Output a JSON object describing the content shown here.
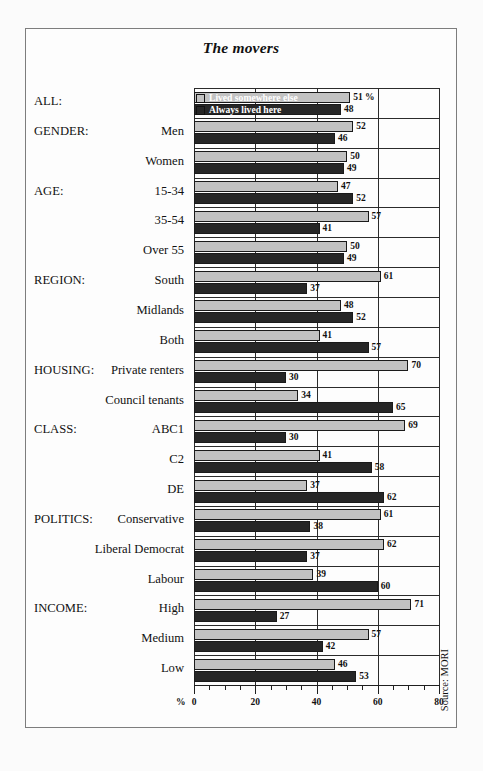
{
  "chart": {
    "title": "The movers",
    "source": "Source: MORI",
    "percent_symbol": "%",
    "legend": [
      {
        "label": "Lived somewhere else",
        "color": "#c2c2c2"
      },
      {
        "label": "Always lived here",
        "color": "#262626"
      }
    ]
  },
  "chart_data": {
    "type": "bar",
    "orientation": "horizontal",
    "title": "The movers",
    "xlabel": "%",
    "ylabel": "",
    "xlim": [
      0,
      80
    ],
    "xticks": [
      0,
      20,
      40,
      60,
      80
    ],
    "minor_tick_step": 5,
    "grid": true,
    "legend_position": "overlaid-on-first-group",
    "source": "Source: MORI",
    "series": [
      {
        "name": "Lived somewhere else",
        "color": "#c2c2c2",
        "values": [
          51,
          52,
          50,
          47,
          57,
          50,
          61,
          48,
          41,
          70,
          34,
          69,
          41,
          37,
          61,
          62,
          39,
          71,
          57,
          46
        ]
      },
      {
        "name": "Always lived here",
        "color": "#262626",
        "values": [
          48,
          46,
          49,
          52,
          41,
          49,
          37,
          52,
          57,
          30,
          65,
          30,
          58,
          62,
          38,
          37,
          60,
          27,
          42,
          53
        ]
      }
    ],
    "categories": [
      "ALL:",
      "Men",
      "Women",
      "15-34",
      "35-54",
      "Over 55",
      "South",
      "Midlands",
      "Both",
      "Private renters",
      "Council tenants",
      "ABC1",
      "C2",
      "DE",
      "Conservative",
      "Liberal Democrat",
      "Labour",
      "High",
      "Medium",
      "Low"
    ],
    "first_value_suffix": "%"
  },
  "rows": [
    {
      "group": "ALL:",
      "label": "",
      "light": 51,
      "dark": 48,
      "light_suffix": " %",
      "dark_suffix": ""
    },
    {
      "group": "GENDER:",
      "label": "Men",
      "light": 52,
      "dark": 46,
      "light_suffix": "",
      "dark_suffix": ""
    },
    {
      "group": "",
      "label": "Women",
      "light": 50,
      "dark": 49,
      "light_suffix": "",
      "dark_suffix": ""
    },
    {
      "group": "AGE:",
      "label": "15-34",
      "light": 47,
      "dark": 52,
      "light_suffix": "",
      "dark_suffix": ""
    },
    {
      "group": "",
      "label": "35-54",
      "light": 57,
      "dark": 41,
      "light_suffix": "",
      "dark_suffix": ""
    },
    {
      "group": "",
      "label": "Over 55",
      "light": 50,
      "dark": 49,
      "light_suffix": "",
      "dark_suffix": ""
    },
    {
      "group": "REGION:",
      "label": "South",
      "light": 61,
      "dark": 37,
      "light_suffix": "",
      "dark_suffix": ""
    },
    {
      "group": "",
      "label": "Midlands",
      "light": 48,
      "dark": 52,
      "light_suffix": "",
      "dark_suffix": ""
    },
    {
      "group": "",
      "label": "Both",
      "light": 41,
      "dark": 57,
      "light_suffix": "",
      "dark_suffix": ""
    },
    {
      "group": "HOUSING:",
      "label": "Private renters",
      "light": 70,
      "dark": 30,
      "light_suffix": "",
      "dark_suffix": ""
    },
    {
      "group": "",
      "label": "Council tenants",
      "light": 34,
      "dark": 65,
      "light_suffix": "",
      "dark_suffix": ""
    },
    {
      "group": "CLASS:",
      "label": "ABC1",
      "light": 69,
      "dark": 30,
      "light_suffix": "",
      "dark_suffix": ""
    },
    {
      "group": "",
      "label": "C2",
      "light": 41,
      "dark": 58,
      "light_suffix": "",
      "dark_suffix": ""
    },
    {
      "group": "",
      "label": "DE",
      "light": 37,
      "dark": 62,
      "light_suffix": "",
      "dark_suffix": ""
    },
    {
      "group": "POLITICS:",
      "label": "Conservative",
      "light": 61,
      "dark": 38,
      "light_suffix": "",
      "dark_suffix": ""
    },
    {
      "group": "",
      "label": "Liberal Democrat",
      "light": 62,
      "dark": 37,
      "light_suffix": "",
      "dark_suffix": ""
    },
    {
      "group": "",
      "label": "Labour",
      "light": 39,
      "dark": 60,
      "light_suffix": "",
      "dark_suffix": ""
    },
    {
      "group": "INCOME:",
      "label": "High",
      "light": 71,
      "dark": 27,
      "light_suffix": "",
      "dark_suffix": ""
    },
    {
      "group": "",
      "label": "Medium",
      "light": 57,
      "dark": 42,
      "light_suffix": "",
      "dark_suffix": ""
    },
    {
      "group": "",
      "label": "Low",
      "light": 46,
      "dark": 53,
      "light_suffix": "",
      "dark_suffix": ""
    }
  ],
  "axis": {
    "ticks": [
      {
        "value": 0,
        "text": "0"
      },
      {
        "value": 20,
        "text": "20"
      },
      {
        "value": 40,
        "text": "40"
      },
      {
        "value": 60,
        "text": "60"
      },
      {
        "value": 80,
        "text": "80"
      }
    ]
  }
}
